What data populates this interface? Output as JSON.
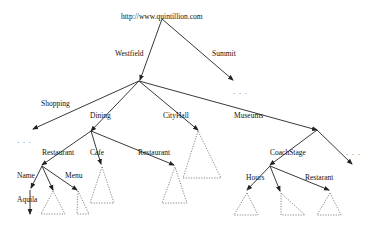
{
  "diagram": {
    "type": "tree",
    "root": {
      "label": "http://www.quintillion.com"
    },
    "edge_labels": {
      "westfield": "Westfield",
      "summit": "Summit",
      "shopping": "Shopping",
      "dining": "Dining",
      "cityhall": "CityHall",
      "museums": "Museums",
      "restaurant_left": "Restaurant",
      "cafe": "Cafe",
      "restaurant_mid": "Restaurant",
      "coachstage": "CoachStage",
      "name": "Name",
      "menu": "Menu",
      "aquila": "Aquila",
      "hours": "Hours",
      "restarant": "Restarant"
    },
    "ellipsis": {
      "summit_more": ". . .",
      "shopping_more": ". . .",
      "museums_more": ". . ."
    }
  }
}
